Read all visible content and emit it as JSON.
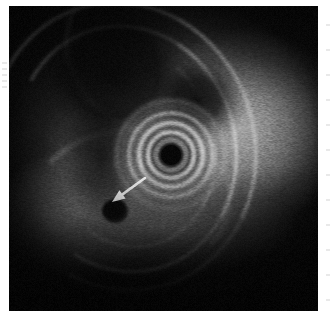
{
  "image": {
    "title": "Endoscopic ultrasound (EUS) radial scan",
    "modality": "Endoscopic Ultrasound",
    "description": "Grayscale radial endosonographic image showing concentric ring-down artifact from the central transducer, layered gut wall, and a hypoechoic lesion marked by a white arrow.",
    "canvas": {
      "width": 332,
      "height": 321
    },
    "frame": {
      "left": 9,
      "top": 6,
      "width": 309,
      "height": 305,
      "background": "#050505"
    },
    "border_color": "#ffffff"
  },
  "transducer": {
    "label": "transducer-ring-down-artifact",
    "center": {
      "x": 171,
      "y": 155
    },
    "core": {
      "diameter": 20,
      "color": "#030303"
    },
    "rings": [
      {
        "diameter": 22,
        "color": "#0b0b0b",
        "border": 1,
        "opacity": 1.0
      },
      {
        "diameter": 29,
        "color": "#6e6e6e",
        "border": 3,
        "opacity": 0.85
      },
      {
        "diameter": 35,
        "color": "#151515",
        "border": 2.5,
        "opacity": 0.9
      },
      {
        "diameter": 43,
        "color": "#c8c8c8",
        "border": 3.5,
        "opacity": 0.88
      },
      {
        "diameter": 51,
        "color": "#4a4a4a",
        "border": 3,
        "opacity": 0.75
      },
      {
        "diameter": 60,
        "color": "#d8d8d8",
        "border": 4,
        "opacity": 0.8
      },
      {
        "diameter": 70,
        "color": "#5a5a5a",
        "border": 3.5,
        "opacity": 0.6
      },
      {
        "diameter": 80,
        "color": "#cfcfcf",
        "border": 4,
        "opacity": 0.62
      },
      {
        "diameter": 92,
        "color": "#6a6a6a",
        "border": 4,
        "opacity": 0.4
      },
      {
        "diameter": 104,
        "color": "#b8b8b8",
        "border": 4,
        "opacity": 0.34
      }
    ]
  },
  "annotation": {
    "arrow": {
      "name": "lesion-pointer-arrow",
      "color": "#ffffff",
      "tail": {
        "x": 145,
        "y": 178
      },
      "tip": {
        "x": 112,
        "y": 202
      },
      "direction": "down-left"
    },
    "lesion": {
      "name": "hypoechoic-lesion",
      "center": {
        "x": 115,
        "y": 211
      },
      "width": 26,
      "height": 24,
      "echogenicity": "hypoechoic"
    }
  },
  "scale": {
    "label": "depth-scale",
    "right_ticks_y": [
      24,
      49,
      74,
      99,
      124,
      149,
      174,
      199,
      224,
      249,
      274,
      299
    ],
    "left_ticks_y": [
      62,
      68,
      74,
      80,
      86
    ],
    "tick_color": "#e9e9e9"
  },
  "regions": [
    {
      "name": "dark-lumen-crescent-upper-left",
      "echo": "anechoic"
    },
    {
      "name": "layered-gut-wall-arcs",
      "echo": "alternating hyperechoic/hypoechoic"
    },
    {
      "name": "parenchyma-right",
      "echo": "homogeneous mid-echoic"
    },
    {
      "name": "far-field-attenuation-bottom",
      "echo": "attenuated"
    }
  ]
}
